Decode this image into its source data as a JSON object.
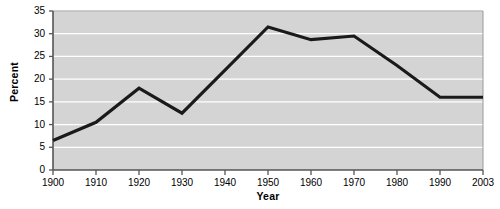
{
  "chart_data": {
    "type": "line",
    "title": "",
    "xlabel": "Year",
    "ylabel": "Percent",
    "x": [
      1900,
      1910,
      1920,
      1930,
      1940,
      1950,
      1960,
      1970,
      1980,
      1990,
      2003
    ],
    "categories": [
      "1900",
      "1910",
      "1920",
      "1930",
      "1940",
      "1950",
      "1960",
      "1970",
      "1980",
      "1990",
      "2003"
    ],
    "values": [
      6.5,
      10.5,
      18,
      12.5,
      22,
      31.5,
      28.7,
      29.5,
      23,
      16,
      16
    ],
    "series": [
      {
        "name": "Percent",
        "values": [
          6.5,
          10.5,
          18,
          12.5,
          22,
          31.5,
          28.7,
          29.5,
          23,
          16,
          16
        ],
        "color": "#1a1a1a"
      }
    ],
    "xlim": [
      1900,
      2003
    ],
    "ylim": [
      0,
      35
    ],
    "ytick_labels": [
      "0",
      "5",
      "10",
      "15",
      "20",
      "25",
      "30",
      "35"
    ],
    "yticks": [
      0,
      5,
      10,
      15,
      20,
      25,
      30,
      35
    ],
    "grid": "horizontal",
    "grid_color": "#ffffff",
    "plot_background": "#d4d4d4",
    "figure_background": "#ffffff",
    "axis_color": "#555555",
    "legend": null,
    "legend_position": "none",
    "annotations": []
  }
}
